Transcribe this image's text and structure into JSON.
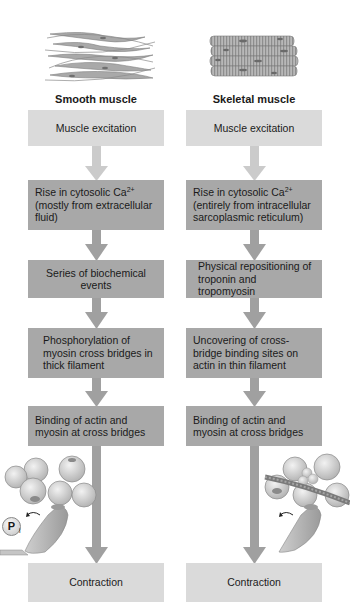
{
  "colors": {
    "light_box": "#dadada",
    "dark_box": "#a8a8a8",
    "light_arrow": "#cbcbcb",
    "dark_arrow": "#a0a0a0",
    "text": "#1a1a1a"
  },
  "smooth": {
    "title": "Smooth muscle",
    "illustration": "smooth-muscle-cells-icon",
    "steps": [
      {
        "text": "Muscle excitation",
        "style": "light"
      },
      {
        "text_pre": "Rise in cytosolic Ca",
        "sup": "2+",
        "text_post": "(mostly from extracellular fluid)",
        "style": "dark"
      },
      {
        "text": "Series of biochemical events",
        "style": "dark"
      },
      {
        "text": "Phosphorylation of myosin cross bridges in thick filament",
        "style": "dark"
      },
      {
        "text": "Binding of actin and myosin at cross bridges",
        "style": "dark"
      },
      {
        "text": "Contraction",
        "style": "light"
      }
    ],
    "molecule_label": "P",
    "molecule_sub": "i"
  },
  "skeletal": {
    "title": "Skeletal muscle",
    "illustration": "skeletal-muscle-fibers-icon",
    "steps": [
      {
        "text": "Muscle excitation",
        "style": "light"
      },
      {
        "text_pre": "Rise in cytosolic Ca",
        "sup": "2+",
        "text_post": "(entirely from intracellular sarcoplasmic reticulum)",
        "style": "dark"
      },
      {
        "text": "Physical repositioning of troponin and tropomyosin",
        "style": "dark"
      },
      {
        "text": "Uncovering of cross-bridge binding sites on actin in thin filament",
        "style": "dark"
      },
      {
        "text": "Binding of actin and myosin at cross bridges",
        "style": "dark"
      },
      {
        "text": "Contraction",
        "style": "light"
      }
    ]
  }
}
